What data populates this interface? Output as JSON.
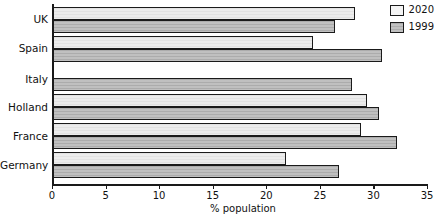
{
  "chart_data": {
    "type": "bar",
    "orientation": "horizontal",
    "title": "",
    "subtitle": "",
    "xlabel": "% population",
    "ylabel": "",
    "xlim": [
      0,
      35
    ],
    "xticks": [
      0,
      5,
      10,
      15,
      20,
      25,
      30,
      35
    ],
    "xtick_labels": [
      "0",
      "5",
      "10",
      "15",
      "20",
      "25",
      "30",
      "35"
    ],
    "grid": false,
    "legend_position": "top-right",
    "categories": [
      "UK",
      "Spain",
      "Italy",
      "Holland",
      "France",
      "Germany"
    ],
    "series": [
      {
        "name": "2020",
        "color": "#ececec",
        "values": [
          28.3,
          24.4,
          null,
          29.4,
          28.8,
          21.8
        ]
      },
      {
        "name": "1999",
        "color": "#b9b9b9",
        "values": [
          26.4,
          30.8,
          28.0,
          30.5,
          32.2,
          26.8
        ]
      }
    ]
  },
  "legend": {
    "entries": [
      {
        "label": "2020",
        "swatch": "light-swatch"
      },
      {
        "label": "1999",
        "swatch": "gray-swatch"
      }
    ]
  },
  "axis": {
    "x_title": "% population",
    "tick_0": "0",
    "tick_5": "5",
    "tick_10": "10",
    "tick_15": "15",
    "tick_20": "20",
    "tick_25": "25",
    "tick_30": "30",
    "tick_35": "35"
  },
  "categories": {
    "uk": "UK",
    "spain": "Spain",
    "italy": "Italy",
    "holland": "Holland",
    "france": "France",
    "germany": "Germany"
  }
}
